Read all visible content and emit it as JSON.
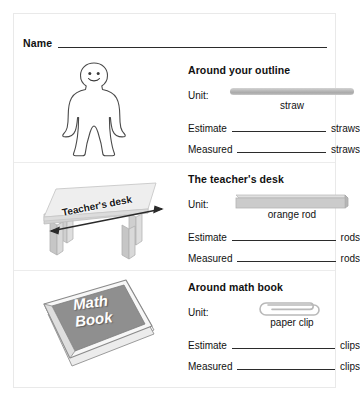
{
  "worksheet": {
    "name_label": "Name",
    "sections": [
      {
        "title": "Around your outline",
        "illustration": "person-outline-figure",
        "illustration_label": "",
        "unit_label": "Unit:",
        "unit_icon": "straw-icon",
        "unit_caption": "straw",
        "estimate_label": "Estimate",
        "estimate_value": "",
        "estimate_unit": "straws",
        "measured_label": "Measured",
        "measured_value": "",
        "measured_unit": "straws"
      },
      {
        "title": "The teacher's desk",
        "illustration": "teachers-desk-figure",
        "illustration_label": "Teacher's desk",
        "unit_label": "Unit:",
        "unit_icon": "orange-rod-icon",
        "unit_caption": "orange rod",
        "estimate_label": "Estimate",
        "estimate_value": "",
        "estimate_unit": "rods",
        "measured_label": "Measured",
        "measured_value": "",
        "measured_unit": "rods"
      },
      {
        "title": "Around math book",
        "illustration": "math-book-figure",
        "illustration_label": "Math\nBook",
        "illustration_label_line1": "Math",
        "illustration_label_line2": "Book",
        "unit_label": "Unit:",
        "unit_icon": "paper-clip-icon",
        "unit_caption": "paper clip",
        "estimate_label": "Estimate",
        "estimate_value": "",
        "estimate_unit": "clips",
        "measured_label": "Measured",
        "measured_value": "",
        "measured_unit": "clips"
      }
    ]
  },
  "colors": {
    "ink": "#111111",
    "rule": "#2b2b2b",
    "border": "#e9e9e9",
    "straw_gray": "#b9b9b9",
    "rod_gray": "#c2c2c2",
    "book_gray": "#8f8f8f",
    "desk_gray": "#e2e2e2"
  }
}
